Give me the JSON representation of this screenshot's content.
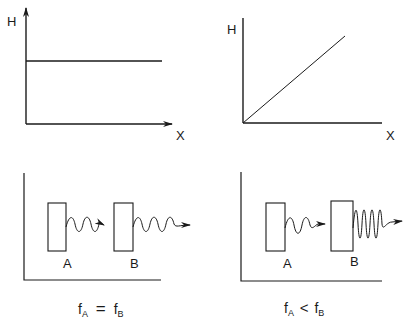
{
  "panels": {
    "top_left": {
      "y_label": "H",
      "x_label": "X",
      "curve": "constant"
    },
    "top_right": {
      "y_label": "H",
      "x_label": "X",
      "curve": "linear-increasing"
    },
    "bottom_left": {
      "box_a_label": "A",
      "box_b_label": "B",
      "caption": {
        "f1": "f",
        "s1": "A",
        "op": "=",
        "f2": "f",
        "s2": "B"
      }
    },
    "bottom_right": {
      "box_a_label": "A",
      "box_b_label": "B",
      "caption": {
        "f1": "f",
        "s1": "A",
        "op": "<",
        "f2": "f",
        "s2": "B"
      }
    }
  },
  "colors": {
    "ink": "#1a1a1a",
    "background": "#ffffff"
  }
}
